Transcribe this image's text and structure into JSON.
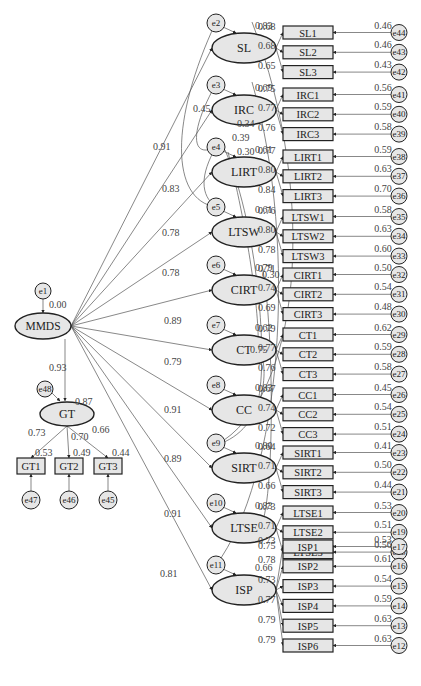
{
  "colors": {
    "node_fill": "#e6e6e6",
    "stroke": "#222222",
    "line": "#555555",
    "label": "#444444",
    "background": "#ffffff"
  },
  "diagram": {
    "type": "Structural Equation Model (second-order CFA)",
    "root": {
      "name": "MMDS",
      "error": "e1",
      "r2": "0.00"
    },
    "second_order_paths": [
      {
        "to": "SL",
        "coef": "0.91"
      },
      {
        "to": "IRC",
        "coef": "0.83"
      },
      {
        "to": "LIRT",
        "coef": "0.78"
      },
      {
        "to": "LTSW",
        "coef": "0.78"
      },
      {
        "to": "CIRT",
        "coef": "0.89"
      },
      {
        "to": "CT",
        "coef": "0.79"
      },
      {
        "to": "CC",
        "coef": "0.91"
      },
      {
        "to": "SIRT",
        "coef": "0.89"
      },
      {
        "to": "LTSE",
        "coef": "0.91"
      },
      {
        "to": "ISP",
        "coef": "0.81"
      },
      {
        "to": "GT",
        "coef": "0.93"
      }
    ],
    "factors": [
      {
        "name": "SL",
        "error": "e2",
        "r2": "0.83",
        "indicators": [
          {
            "name": "SL1",
            "loading": "0.68",
            "r2": "0.46",
            "error": "e44"
          },
          {
            "name": "SL2",
            "loading": "0.68",
            "r2": "0.46",
            "error": "e43"
          },
          {
            "name": "SL3",
            "loading": "0.65",
            "r2": "0.43",
            "error": "e42"
          }
        ]
      },
      {
        "name": "IRC",
        "error": "e3",
        "r2": "0.69",
        "indicators": [
          {
            "name": "IRC1",
            "loading": "0.75",
            "r2": "0.56",
            "error": "e41"
          },
          {
            "name": "IRC2",
            "loading": "0.77",
            "r2": "0.59",
            "error": "e40"
          },
          {
            "name": "IRC3",
            "loading": "0.76",
            "r2": "0.58",
            "error": "e39"
          }
        ]
      },
      {
        "name": "LIRT",
        "error": "e4",
        "r2": "0.61",
        "indicators": [
          {
            "name": "LIRT1",
            "loading": "0.77",
            "r2": "0.59",
            "error": "e38"
          },
          {
            "name": "LIRT2",
            "loading": "0.80",
            "r2": "0.63",
            "error": "e37"
          },
          {
            "name": "LIRT3",
            "loading": "0.84",
            "r2": "0.70",
            "error": "e36"
          }
        ]
      },
      {
        "name": "LTSW",
        "error": "e5",
        "r2": "0.61",
        "indicators": [
          {
            "name": "LTSW1",
            "loading": "0.76",
            "r2": "0.58",
            "error": "e35"
          },
          {
            "name": "LTSW2",
            "loading": "0.80",
            "r2": "0.63",
            "error": "e34"
          },
          {
            "name": "LTSW3",
            "loading": "0.78",
            "r2": "0.60",
            "error": "e33"
          }
        ]
      },
      {
        "name": "CIRT",
        "error": "e6",
        "r2": "0.79",
        "indicators": [
          {
            "name": "CIRT1",
            "loading": "0.71",
            "r2": "0.50",
            "error": "e32"
          },
          {
            "name": "CIRT2",
            "loading": "0.74",
            "r2": "0.54",
            "error": "e31"
          },
          {
            "name": "CIRT3",
            "loading": "0.69",
            "r2": "0.48",
            "error": "e30"
          }
        ]
      },
      {
        "name": "CT",
        "error": "e7",
        "r2": "0.62",
        "indicators": [
          {
            "name": "CT1",
            "loading": "0.79",
            "r2": "0.62",
            "error": "e29"
          },
          {
            "name": "CT2",
            "loading": "0.77",
            "r2": "0.59",
            "error": "e28"
          },
          {
            "name": "CT3",
            "loading": "0.76",
            "r2": "0.58",
            "error": "e27"
          }
        ]
      },
      {
        "name": "CC",
        "error": "e8",
        "r2": "0.83",
        "indicators": [
          {
            "name": "CC1",
            "loading": "0.67",
            "r2": "0.45",
            "error": "e26"
          },
          {
            "name": "CC2",
            "loading": "0.74",
            "r2": "0.54",
            "error": "e25"
          },
          {
            "name": "CC3",
            "loading": "0.72",
            "r2": "0.51",
            "error": "e24"
          }
        ]
      },
      {
        "name": "SIRT",
        "error": "e9",
        "r2": "0.80",
        "indicators": [
          {
            "name": "SIRT1",
            "loading": "0.64",
            "r2": "0.41",
            "error": "e23"
          },
          {
            "name": "SIRT2",
            "loading": "0.71",
            "r2": "0.50",
            "error": "e22"
          },
          {
            "name": "SIRT3",
            "loading": "0.66",
            "r2": "0.44",
            "error": "e21"
          }
        ]
      },
      {
        "name": "LTSE",
        "error": "e10",
        "r2": "0.83",
        "indicators": [
          {
            "name": "LTSE1",
            "loading": "0.73",
            "r2": "0.53",
            "error": "e20"
          },
          {
            "name": "LTSE2",
            "loading": "0.71",
            "r2": "0.51",
            "error": "e19"
          },
          {
            "name": "LTSE3",
            "loading": "0.75",
            "r2": "0.56",
            "error": "e18"
          }
        ]
      },
      {
        "name": "ISP",
        "error": "e11",
        "r2": "0.66",
        "indicators": [
          {
            "name": "ISP1",
            "loading": "0.73",
            "r2": "0.53",
            "error": "e17"
          },
          {
            "name": "ISP2",
            "loading": "0.78",
            "r2": "0.61",
            "error": "e16"
          },
          {
            "name": "ISP3",
            "loading": "0.73",
            "r2": "0.54",
            "error": "e15"
          },
          {
            "name": "ISP4",
            "loading": "0.77",
            "r2": "0.59",
            "error": "e14"
          },
          {
            "name": "ISP5",
            "loading": "0.79",
            "r2": "0.63",
            "error": "e13"
          },
          {
            "name": "ISP6",
            "loading": "0.79",
            "r2": "0.63",
            "error": "e12"
          }
        ]
      }
    ],
    "gt": {
      "name": "GT",
      "error": "e48",
      "r2": "0.87",
      "indicators": [
        {
          "name": "GT1",
          "loading": "0.73",
          "r2": "0.53",
          "error": "e47"
        },
        {
          "name": "GT2",
          "loading": "0.70",
          "r2": "0.49",
          "error": "e46"
        },
        {
          "name": "GT3",
          "loading": "0.66",
          "r2": "0.44",
          "error": "e45"
        }
      ]
    },
    "covariance_labels": [
      "0.45",
      "0.34",
      "0.39",
      "0.30",
      "0.30",
      "0.75"
    ]
  }
}
